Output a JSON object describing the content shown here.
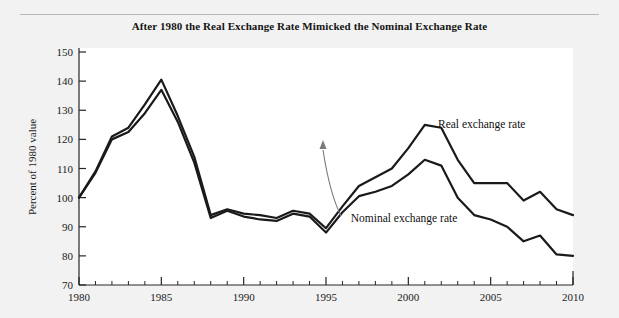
{
  "figure": {
    "title": "After 1980 the Real Exchange Rate Mimicked the Nominal Exchange Rate",
    "background_color": "#f2f2f2",
    "plot_background_color": "#ffffff",
    "rule_color": "#b8b8b8"
  },
  "chart_data": {
    "type": "line",
    "title": "After 1980 the Real Exchange Rate Mimicked the Nominal Exchange Rate",
    "xlabel": "",
    "ylabel": "Percent of 1980 value",
    "xlim": [
      1980,
      2010
    ],
    "ylim": [
      70,
      150
    ],
    "xticks": [
      1980,
      1985,
      1990,
      1995,
      2000,
      2005,
      2010
    ],
    "xtick_labels": [
      "1980",
      "1985",
      "1990",
      "1995",
      "2000",
      "2005",
      "2010"
    ],
    "xminor_step": 1,
    "yticks": [
      70,
      80,
      90,
      100,
      110,
      120,
      130,
      140,
      150
    ],
    "ytick_labels": [
      "70",
      "80",
      "90",
      "100",
      "110",
      "120",
      "130",
      "140",
      "150"
    ],
    "grid": false,
    "legend_position": "inline-annotations",
    "x": [
      1980,
      1981,
      1982,
      1983,
      1984,
      1985,
      1986,
      1987,
      1988,
      1989,
      1990,
      1991,
      1992,
      1993,
      1994,
      1995,
      1996,
      1997,
      1998,
      1999,
      2000,
      2001,
      2002,
      2003,
      2004,
      2005,
      2006,
      2007,
      2008,
      2009,
      2010
    ],
    "series": [
      {
        "name": "Real exchange rate",
        "color": "#1a1a1a",
        "line_width": 2.2,
        "values": [
          100,
          109,
          121,
          124,
          132,
          140.5,
          128,
          114,
          94,
          96,
          94.5,
          94,
          93,
          95.5,
          94.5,
          89.5,
          97,
          104,
          107,
          110,
          117,
          125,
          124,
          113,
          105,
          105,
          105,
          99,
          102,
          96,
          94
        ]
      },
      {
        "name": "Nominal exchange rate",
        "color": "#1a1a1a",
        "line_width": 2.2,
        "values": [
          100,
          108.5,
          120,
          122.5,
          129,
          137,
          126,
          112,
          93,
          95.5,
          93.5,
          92.5,
          92,
          94.5,
          93.5,
          88,
          95,
          100.5,
          102,
          104,
          108,
          113,
          111,
          100,
          94,
          92.5,
          90,
          85,
          87,
          80.5,
          80
        ]
      }
    ],
    "annotations": [
      {
        "name": "real-exchange-rate-label",
        "text": "Real exchange rate",
        "x": 2001.8,
        "y": 124
      },
      {
        "name": "nominal-exchange-rate-label",
        "text": "Nominal exchange rate",
        "x": 1996.5,
        "y": 91.5
      },
      {
        "name": "divergence-arrow",
        "text": "",
        "color": "#6f6f6f"
      }
    ]
  }
}
